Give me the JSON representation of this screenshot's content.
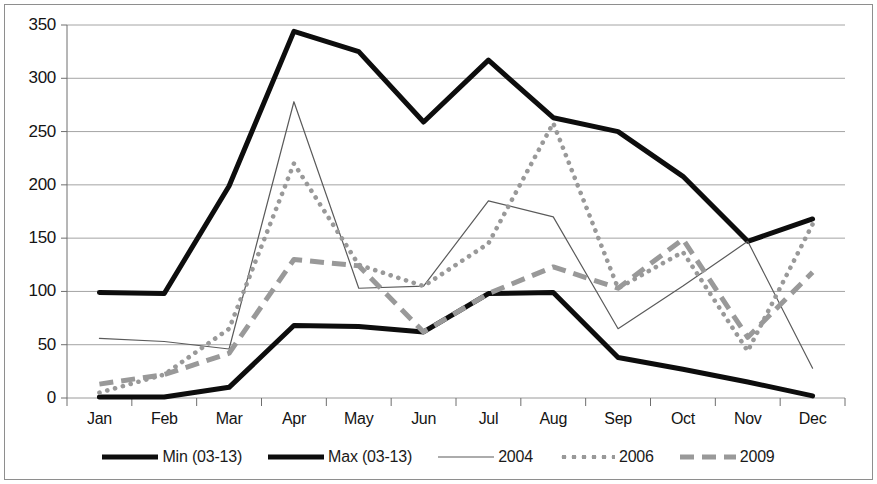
{
  "chart_data": {
    "type": "line",
    "title": "",
    "xlabel": "",
    "ylabel": "",
    "categories": [
      "Jan",
      "Feb",
      "Mar",
      "Apr",
      "May",
      "Jun",
      "Jul",
      "Aug",
      "Sep",
      "Oct",
      "Nov",
      "Dec"
    ],
    "ylim": [
      0,
      350
    ],
    "yticks": [
      0,
      50,
      100,
      150,
      200,
      250,
      300,
      350
    ],
    "grid": true,
    "legend_position": "bottom",
    "series": [
      {
        "name": "Min (03-13)",
        "style": "thick-solid",
        "color": "#0d0d0d",
        "values": [
          1,
          1,
          10,
          68,
          67,
          62,
          98,
          99,
          38,
          27,
          15,
          2
        ]
      },
      {
        "name": "Max (03-13)",
        "style": "thick-solid",
        "color": "#0d0d0d",
        "values": [
          99,
          98,
          199,
          344,
          325,
          259,
          317,
          263,
          250,
          208,
          147,
          168
        ]
      },
      {
        "name": "2004",
        "style": "thin-solid",
        "color": "#5a5a5a",
        "values": [
          56,
          53,
          46,
          278,
          103,
          105,
          185,
          170,
          65,
          105,
          147,
          28
        ]
      },
      {
        "name": "2006",
        "style": "dotted",
        "color": "#999999",
        "values": [
          5,
          22,
          65,
          220,
          125,
          105,
          145,
          258,
          103,
          137,
          44,
          163
        ]
      },
      {
        "name": "2009",
        "style": "dashed",
        "color": "#999999",
        "values": [
          13,
          22,
          42,
          130,
          124,
          62,
          98,
          123,
          103,
          149,
          57,
          118
        ]
      }
    ]
  },
  "axis": {
    "y_tick_labels": [
      "0",
      "50",
      "100",
      "150",
      "200",
      "250",
      "300",
      "350"
    ],
    "x_tick_labels": [
      "Jan",
      "Feb",
      "Mar",
      "Apr",
      "May",
      "Jun",
      "Jul",
      "Aug",
      "Sep",
      "Oct",
      "Nov",
      "Dec"
    ]
  },
  "legend": {
    "items": [
      {
        "label": "Min (03-13)",
        "swatch": "thick-solid-line-swatch"
      },
      {
        "label": "Max (03-13)",
        "swatch": "thick-solid-line-swatch"
      },
      {
        "label": "2004",
        "swatch": "thin-solid-line-swatch"
      },
      {
        "label": "2006",
        "swatch": "dotted-line-swatch"
      },
      {
        "label": "2009",
        "swatch": "dashed-line-swatch"
      }
    ]
  },
  "colors": {
    "series_dark": "#0d0d0d",
    "series_mid": "#5a5a5a",
    "series_light": "#999999",
    "gridline": "#9a9a9a",
    "axis": "#6e6e6e",
    "frame": "#8e8e8e",
    "background": "#ffffff"
  }
}
